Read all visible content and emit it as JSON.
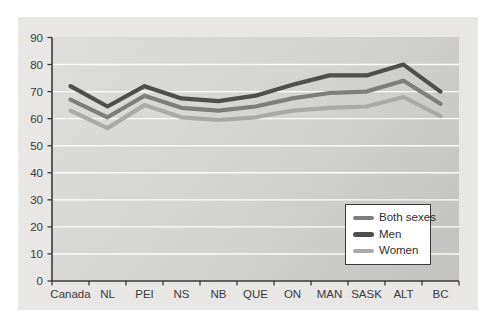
{
  "chart_data": {
    "type": "line",
    "title": "",
    "xlabel": "",
    "ylabel": "",
    "categories": [
      "Canada",
      "NL",
      "PEI",
      "NS",
      "NB",
      "QUE",
      "ON",
      "MAN",
      "SASK",
      "ALT",
      "BC"
    ],
    "series": [
      {
        "name": "Both sexes",
        "color": "#7d7d7b",
        "values": [
          67,
          60.5,
          68.5,
          64,
          63,
          64.5,
          67.5,
          69.5,
          70,
          74,
          65.5
        ]
      },
      {
        "name": "Men",
        "color": "#4e4e4c",
        "values": [
          72,
          64.5,
          72,
          67.5,
          66.5,
          68.5,
          72.5,
          76,
          76,
          80,
          70
        ]
      },
      {
        "name": "Women",
        "color": "#a9a9a7",
        "values": [
          63,
          56.5,
          65,
          60.5,
          59.5,
          60.5,
          63,
          64,
          64.5,
          68,
          61
        ]
      }
    ],
    "ylim": [
      0,
      90
    ],
    "y_ticks": [
      0,
      10,
      20,
      30,
      40,
      50,
      60,
      70,
      80,
      90
    ],
    "grid": "horizontal-white-lines",
    "legend_position": "lower-right",
    "legend_order": [
      "Both sexes",
      "Men",
      "Women"
    ],
    "plot_background": "gray-gradient",
    "axis_color": "#3a3a3a",
    "gridline_color": "#fafaf8"
  }
}
